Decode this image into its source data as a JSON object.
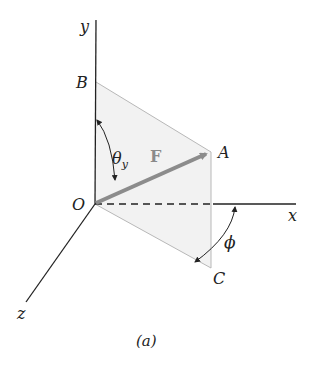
{
  "figure": {
    "caption": "(a)",
    "axes": {
      "x": "x",
      "y": "y",
      "z": "z"
    },
    "points": {
      "origin": "O",
      "A": "A",
      "B": "B",
      "C": "C"
    },
    "vector": {
      "label": "F"
    },
    "angles": {
      "theta_y": "θ",
      "theta_sub": "y",
      "phi": "ϕ"
    },
    "colors": {
      "plane_fill": "#f2f2f2",
      "plane_edge": "#b8b8b8",
      "vector": "#8c8c8c",
      "axis": "#222222"
    }
  }
}
